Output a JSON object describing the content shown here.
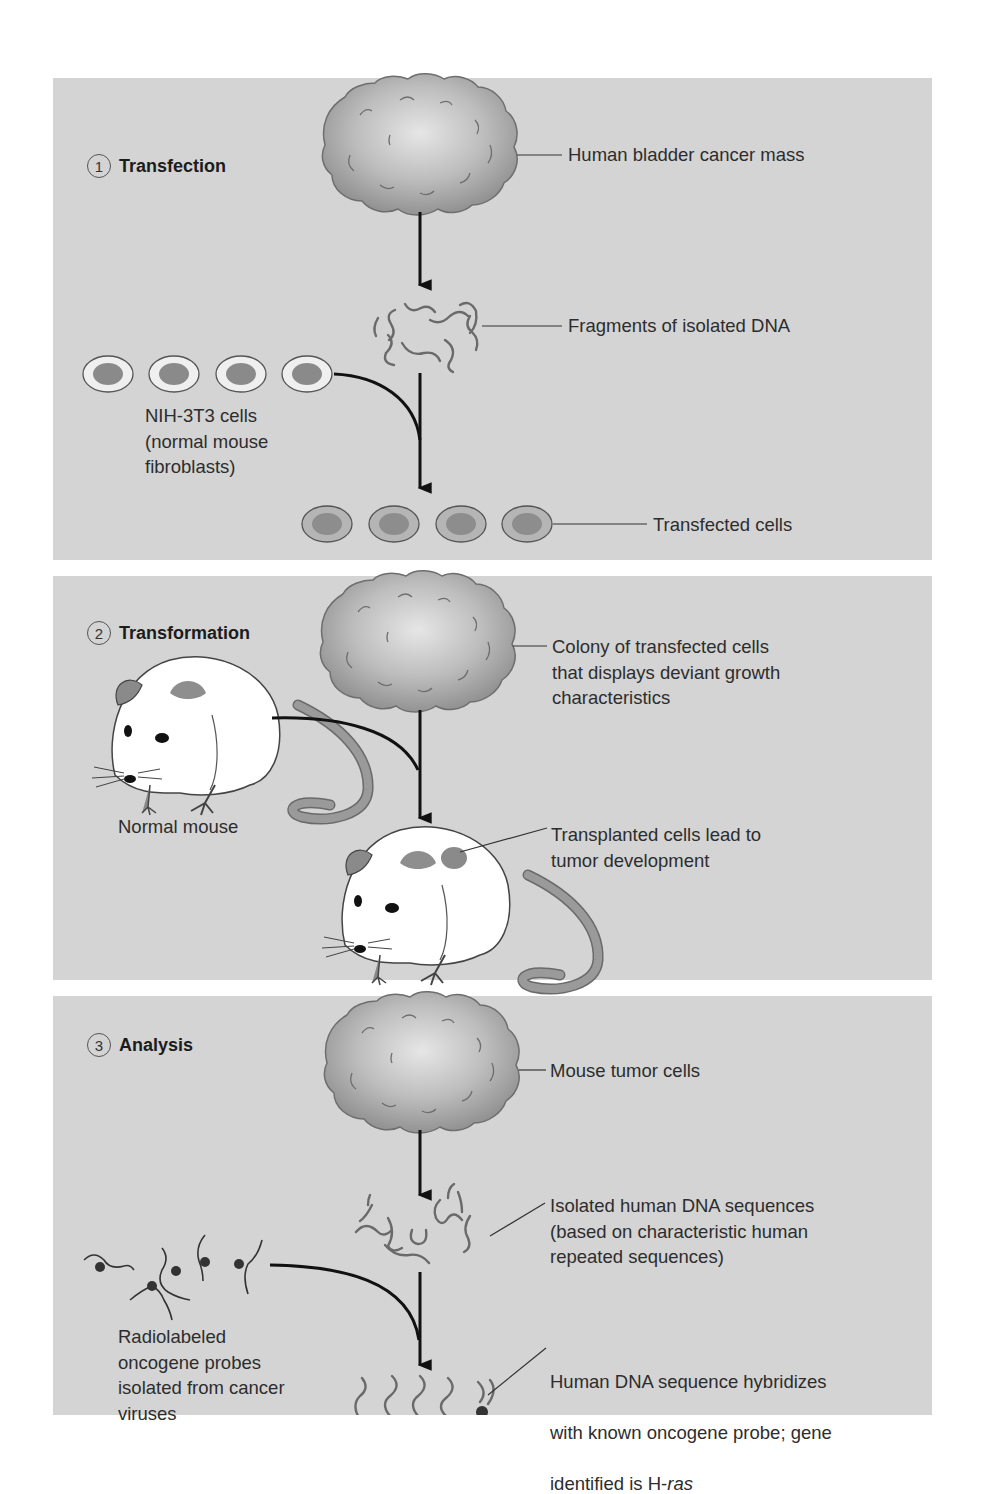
{
  "colors": {
    "panel_bg": "#d4d4d4",
    "page_bg": "#ffffff",
    "cell_nucleus": "#8a8a8a",
    "cell_membrane_normal": "#eeeeee",
    "cell_membrane_transfected": "#b5b5b5",
    "arrow": "#111111",
    "dna_strand": "#6a6a6a",
    "tumor_mass": "#a9a9a9"
  },
  "panels": [
    {
      "step_number": "1",
      "title": "Transfection",
      "labels": {
        "mass": "Human bladder cancer mass",
        "dna": "Fragments of isolated DNA",
        "cells": "NIH-3T3 cells\n(normal mouse\nfibroblasts)",
        "transfected": "Transfected cells"
      },
      "icons": [
        "tumor-mass-icon",
        "dna-fragments-icon",
        "normal-cell-icon",
        "transfected-cell-icon",
        "arrow-down-icon",
        "curved-arrow-icon"
      ]
    },
    {
      "step_number": "2",
      "title": "Transformation",
      "labels": {
        "colony": "Colony of transfected cells\nthat displays deviant growth\ncharacteristics",
        "normal_mouse": "Normal mouse",
        "tumor": "Transplanted cells lead to\ntumor development"
      },
      "icons": [
        "colony-mass-icon",
        "mouse-icon",
        "tumor-mouse-icon",
        "arrow-down-icon",
        "curved-arrow-icon"
      ]
    },
    {
      "step_number": "3",
      "title": "Analysis",
      "labels": {
        "tumor_cells": "Mouse tumor cells",
        "human_dna": "Isolated human DNA sequences\n(based on characteristic human\nrepeated sequences)",
        "probes": "Radiolabeled\noncogene probes\nisolated from cancer\nviruses",
        "hybrid_line1": "Human DNA sequence hybridizes",
        "hybrid_line2": "with known oncogene probe; gene",
        "hybrid_line3_prefix": "identified is H-",
        "hybrid_line3_gene": "ras"
      },
      "icons": [
        "tumor-mass-icon",
        "dna-fragments-icon",
        "radiolabeled-probe-icon",
        "hybridized-dna-icon",
        "arrow-down-icon",
        "curved-arrow-icon"
      ]
    }
  ]
}
